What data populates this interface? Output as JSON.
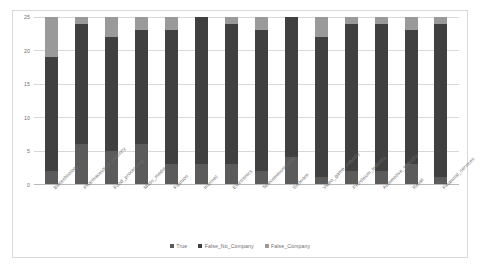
{
  "chart_data": {
    "type": "bar",
    "stacked": true,
    "title": "",
    "xlabel": "",
    "ylabel": "",
    "ylim": [
      0,
      25
    ],
    "yticks": [
      0,
      5,
      10,
      15,
      20,
      25
    ],
    "grid": true,
    "legend_position": "bottom",
    "categories": [
      "Biotechnology",
      "Pharmaceutical_Industry",
      "Food_processing",
      "Mass_media",
      "Fashion",
      "Internet",
      "Electronics",
      "Telecommunication",
      "Software",
      "Video_game_industry",
      "Petroleum_industry",
      "Automotive_Industry",
      "Retail",
      "Financial_services"
    ],
    "series": [
      {
        "name": "True",
        "color": "#5b5b5b",
        "values": [
          2,
          6,
          5,
          6,
          3,
          3,
          3,
          2,
          4,
          1,
          2,
          2,
          3,
          1
        ]
      },
      {
        "name": "False_No_Company",
        "color": "#404040",
        "values": [
          17,
          18,
          17,
          17,
          20,
          22,
          21,
          21,
          21,
          21,
          22,
          22,
          20,
          23
        ]
      },
      {
        "name": "False_Company",
        "color": "#9a9a9a",
        "values": [
          6,
          1,
          3,
          2,
          2,
          0,
          1,
          2,
          0,
          3,
          1,
          1,
          2,
          1
        ]
      }
    ]
  },
  "legend": {
    "marker": "■",
    "items": [
      {
        "label": "True",
        "color": "#5b5b5b"
      },
      {
        "label": "False_No_Company",
        "color": "#404040"
      },
      {
        "label": "False_Company",
        "color": "#9a9a9a"
      }
    ]
  }
}
